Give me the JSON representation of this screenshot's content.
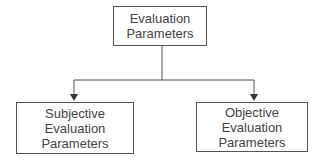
{
  "diagram": {
    "root": {
      "lines": [
        "Evaluation",
        "Parameters"
      ]
    },
    "children": [
      {
        "lines": [
          "Subjective",
          "Evaluation",
          "Parameters"
        ]
      },
      {
        "lines": [
          "Objective",
          "Evaluation",
          "Parameters"
        ]
      }
    ],
    "colors": {
      "line": "#555555",
      "text": "#444444",
      "background": "#ffffff"
    }
  }
}
